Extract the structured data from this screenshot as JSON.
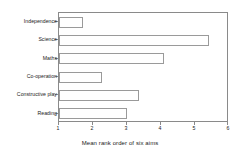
{
  "chart_data": {
    "type": "bar",
    "orientation": "horizontal",
    "title": "",
    "xlabel": "Mean rank order of six aims",
    "ylabel": "",
    "categories": [
      "Independence",
      "Science",
      "Maths",
      "Co-operation",
      "Constructive play",
      "Reading"
    ],
    "values": [
      1.7,
      5.4,
      4.1,
      2.25,
      3.35,
      3.0
    ],
    "xlim": [
      1,
      6
    ],
    "xticks": [
      1,
      2,
      3,
      4,
      5,
      6
    ],
    "xtick_labels": [
      "1",
      "2",
      "3",
      "4",
      "5",
      "6"
    ],
    "grid": false,
    "legend": false,
    "bar_fill_color": "#ffffff",
    "bar_edge_color": "#9a9a9a",
    "axis_color": "#8a8a8a",
    "text_color": "#1a1a1a"
  }
}
